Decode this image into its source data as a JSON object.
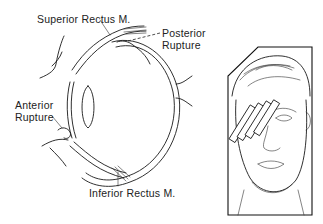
{
  "figure": {
    "eye_diagram": {
      "labels": {
        "superior_rectus": "Superior Rectus M.",
        "posterior_rupture_line1": "Posterior",
        "posterior_rupture_line2": "Rupture",
        "anterior_rupture_line1": "Anterior",
        "anterior_rupture_line2": "Rupture",
        "inferior_rectus": "Inferior Rectus M."
      }
    },
    "inset": {
      "subject": "face with bandage strips over right eye"
    }
  }
}
